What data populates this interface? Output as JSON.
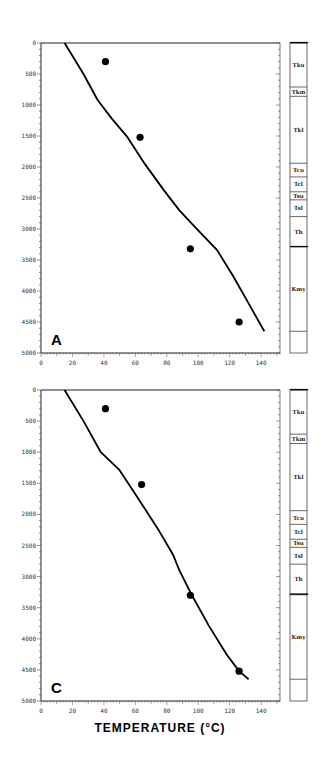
{
  "chart_data": [
    {
      "type": "line",
      "panel_label": "A",
      "xlabel": "TEMPERATURE (°C)",
      "ylabel": "",
      "xlim": [
        0,
        152
      ],
      "ylim": [
        5000,
        0
      ],
      "x_ticks": [
        0,
        20,
        40,
        60,
        80,
        100,
        120,
        140
      ],
      "y_ticks": [
        0,
        500,
        1000,
        1500,
        2000,
        2500,
        3000,
        3500,
        4000,
        4500,
        5000
      ],
      "grid": false,
      "series": [
        {
          "name": "modeled temperature profile",
          "kind": "line",
          "points": [
            [
              15,
              0
            ],
            [
              27,
              500
            ],
            [
              36,
              920
            ],
            [
              45,
              1220
            ],
            [
              55,
              1520
            ],
            [
              66,
              1950
            ],
            [
              78,
              2370
            ],
            [
              88,
              2700
            ],
            [
              98,
              2970
            ],
            [
              112,
              3340
            ],
            [
              122,
              3750
            ],
            [
              132,
              4200
            ],
            [
              142,
              4650
            ]
          ]
        },
        {
          "name": "measured temperatures",
          "kind": "scatter",
          "points": [
            [
              41,
              300
            ],
            [
              63,
              1520
            ],
            [
              95,
              3320
            ],
            [
              126,
              4500
            ]
          ]
        }
      ],
      "strat_column": [
        {
          "unit": "Tku",
          "top": 0,
          "bottom": 710,
          "top_boundary": "unconformity"
        },
        {
          "unit": "Tkm",
          "top": 710,
          "bottom": 860
        },
        {
          "unit": "Tkl",
          "top": 860,
          "bottom": 1940
        },
        {
          "unit": "Tcu",
          "top": 1940,
          "bottom": 2160
        },
        {
          "unit": "Tcl",
          "top": 2160,
          "bottom": 2400
        },
        {
          "unit": "Tsu",
          "top": 2400,
          "bottom": 2530
        },
        {
          "unit": "Tsl",
          "top": 2530,
          "bottom": 2800
        },
        {
          "unit": "Th",
          "top": 2800,
          "bottom": 3290
        },
        {
          "unit": "Kmy",
          "top": 3290,
          "bottom": 4650,
          "top_boundary": "unconformity"
        },
        {
          "unit": "",
          "top": 4650,
          "bottom": 5000
        }
      ]
    },
    {
      "type": "line",
      "panel_label": "C",
      "xlabel": "TEMPERATURE (°C)",
      "ylabel": "",
      "xlim": [
        0,
        152
      ],
      "ylim": [
        5000,
        0
      ],
      "x_ticks": [
        0,
        20,
        40,
        60,
        80,
        100,
        120,
        140
      ],
      "y_ticks": [
        0,
        500,
        1000,
        1500,
        2000,
        2500,
        3000,
        3500,
        4000,
        4500,
        5000
      ],
      "grid": false,
      "series": [
        {
          "name": "modeled temperature profile",
          "kind": "line",
          "points": [
            [
              15,
              0
            ],
            [
              27,
              500
            ],
            [
              38,
              1000
            ],
            [
              50,
              1290
            ],
            [
              62,
              1750
            ],
            [
              75,
              2260
            ],
            [
              84,
              2650
            ],
            [
              88,
              2900
            ],
            [
              96,
              3300
            ],
            [
              107,
              3800
            ],
            [
              118,
              4250
            ],
            [
              126,
              4520
            ],
            [
              132,
              4650
            ]
          ]
        },
        {
          "name": "measured temperatures",
          "kind": "scatter",
          "points": [
            [
              41,
              300
            ],
            [
              64,
              1520
            ],
            [
              95,
              3300
            ],
            [
              126,
              4520
            ]
          ]
        }
      ],
      "strat_column": [
        {
          "unit": "Tku",
          "top": 0,
          "bottom": 710,
          "top_boundary": "unconformity"
        },
        {
          "unit": "Tkm",
          "top": 710,
          "bottom": 860
        },
        {
          "unit": "Tkl",
          "top": 860,
          "bottom": 1940
        },
        {
          "unit": "Tcu",
          "top": 1940,
          "bottom": 2160
        },
        {
          "unit": "Tcl",
          "top": 2160,
          "bottom": 2400
        },
        {
          "unit": "Tsu",
          "top": 2400,
          "bottom": 2530
        },
        {
          "unit": "Tsl",
          "top": 2530,
          "bottom": 2800
        },
        {
          "unit": "Th",
          "top": 2800,
          "bottom": 3290
        },
        {
          "unit": "Kmy",
          "top": 3290,
          "bottom": 4650,
          "top_boundary": "unconformity"
        },
        {
          "unit": "",
          "top": 4650,
          "bottom": 5000
        }
      ]
    }
  ],
  "figure": {
    "x_axis_title": "TEMPERATURE (°C)"
  }
}
